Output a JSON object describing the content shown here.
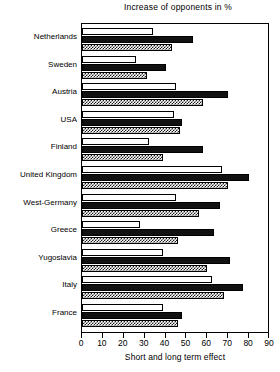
{
  "chart_data": {
    "type": "bar",
    "orientation": "horizontal",
    "title": "Increase of opponents in %",
    "xlabel": "Short and long term effect",
    "ylabel": "",
    "xlim": [
      0,
      90
    ],
    "xticks": [
      0,
      10,
      20,
      30,
      40,
      50,
      60,
      70,
      80,
      90
    ],
    "grid": false,
    "legend": null,
    "categories": [
      "Netherlands",
      "Sweden",
      "Austria",
      "USA",
      "Finland",
      "United Kingdom",
      "West-Germany",
      "Greece",
      "Yugoslavia",
      "Italy",
      "France"
    ],
    "series": [
      {
        "name": "white",
        "style": "open",
        "values": [
          34,
          26,
          45,
          44,
          32,
          67,
          45,
          28,
          39,
          62,
          39
        ]
      },
      {
        "name": "black",
        "style": "solid-black",
        "values": [
          53,
          40,
          70,
          48,
          58,
          80,
          66,
          63,
          71,
          77,
          48
        ]
      },
      {
        "name": "checker",
        "style": "checkered",
        "values": [
          43,
          31,
          58,
          47,
          39,
          70,
          56,
          46,
          60,
          68,
          46
        ]
      }
    ]
  },
  "axis": {
    "ticklabels": [
      "0",
      "10",
      "20",
      "30",
      "40",
      "50",
      "60",
      "70",
      "80",
      "90"
    ]
  }
}
